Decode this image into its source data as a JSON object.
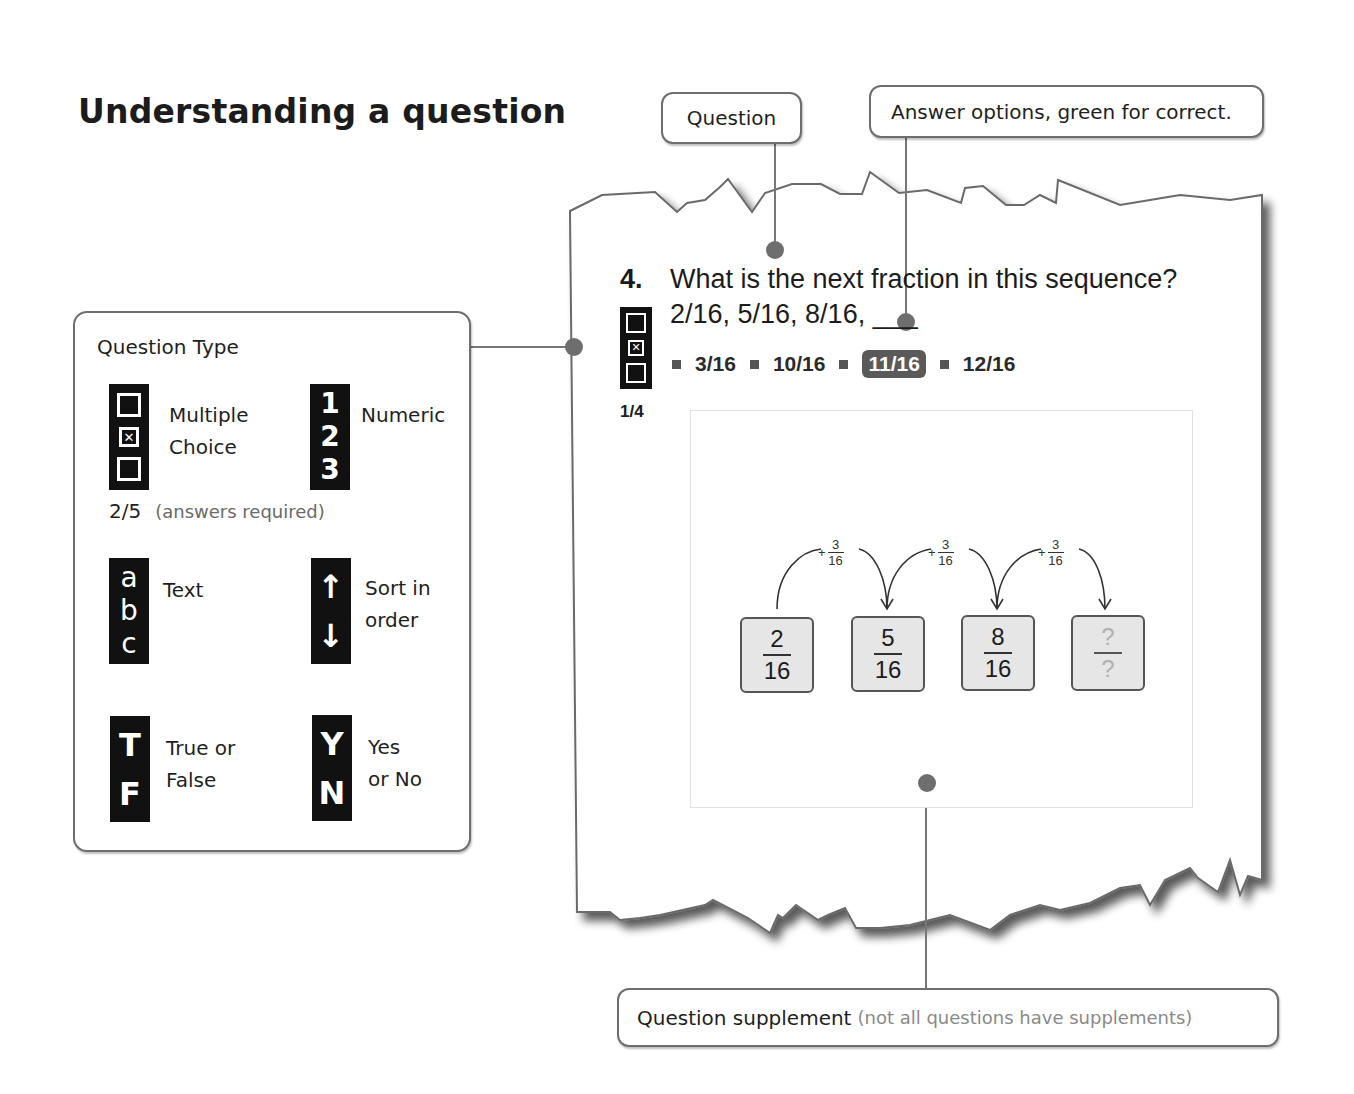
{
  "page": {
    "title": "Understanding a question"
  },
  "callouts": {
    "question": "Question",
    "answer_options": "Answer options, green for correct.",
    "supplement": {
      "label": "Question supplement",
      "note": "(not all questions have supplements)"
    }
  },
  "question_types": {
    "heading": "Question Type",
    "items": [
      {
        "id": "multiple-choice",
        "icon": "checkbox-stack-icon",
        "label_line1": "Multiple",
        "label_line2": "Choice"
      },
      {
        "id": "numeric",
        "icon": "numeric-123-icon",
        "glyphs": [
          "1",
          "2",
          "3"
        ],
        "label_line1": "Numeric",
        "label_line2": ""
      },
      {
        "id": "text",
        "icon": "text-abc-icon",
        "glyphs": [
          "a",
          "b",
          "c"
        ],
        "label_line1": "Text",
        "label_line2": ""
      },
      {
        "id": "sort",
        "icon": "sort-arrows-icon",
        "glyphs": [
          "↑",
          "↓"
        ],
        "label_line1": "Sort in",
        "label_line2": "order"
      },
      {
        "id": "true-false",
        "icon": "true-false-icon",
        "glyphs": [
          "T",
          "F"
        ],
        "label_line1": "True or",
        "label_line2": "False"
      },
      {
        "id": "yes-no",
        "icon": "yes-no-icon",
        "glyphs": [
          "Y",
          "N"
        ],
        "label_line1": "Yes",
        "label_line2": "or No"
      }
    ],
    "mc_count": "2/5",
    "mc_count_note": "(answers required)"
  },
  "question": {
    "number": "4.",
    "text_line1": "What is the next fraction in this sequence?",
    "text_line2": "2/16, 5/16, 8/16, ___",
    "answers_count": "1/4",
    "options": [
      {
        "label": "3/16",
        "correct": false
      },
      {
        "label": "10/16",
        "correct": false
      },
      {
        "label": "11/16",
        "correct": true
      },
      {
        "label": "12/16",
        "correct": false
      }
    ]
  },
  "supplement": {
    "step": {
      "sign": "+",
      "numerator": "3",
      "denominator": "16"
    },
    "cards": [
      {
        "numerator": "2",
        "denominator": "16"
      },
      {
        "numerator": "5",
        "denominator": "16"
      },
      {
        "numerator": "8",
        "denominator": "16"
      },
      {
        "numerator": "?",
        "denominator": "?"
      }
    ]
  },
  "colors": {
    "connector": "#777777",
    "correct_option_bg": "#5a5a5a",
    "icon_bg": "#111111"
  }
}
